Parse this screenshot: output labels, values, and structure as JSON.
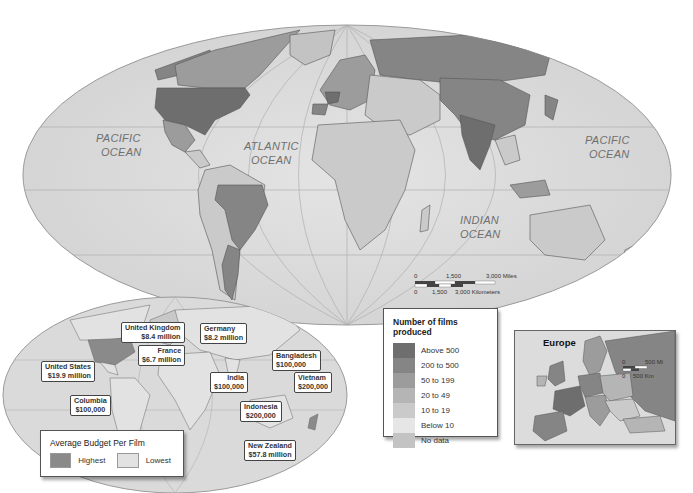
{
  "main_map": {
    "oceans": [
      {
        "name": "pacific-west",
        "line1": "PACIFIC",
        "line2": "OCEAN"
      },
      {
        "name": "atlantic",
        "line1": "ATLANTIC",
        "line2": "OCEAN"
      },
      {
        "name": "indian",
        "line1": "INDIAN",
        "line2": "OCEAN"
      },
      {
        "name": "pacific-east",
        "line1": "PACIFIC",
        "line2": "OCEAN"
      }
    ],
    "scale_bar": {
      "miles": [
        "0",
        "1,500",
        "3,000 Miles"
      ],
      "kilometers": [
        "0",
        "1,500",
        "3,000 Kilometers"
      ]
    }
  },
  "films_legend": {
    "title": "Number of films produced",
    "items": [
      {
        "label": "Above 500",
        "color": "#6e6e6e"
      },
      {
        "label": "200 to 500",
        "color": "#858585"
      },
      {
        "label": "50 to 199",
        "color": "#9c9c9c"
      },
      {
        "label": "20 to 49",
        "color": "#b5b5b5"
      },
      {
        "label": "10 to 19",
        "color": "#cacaca"
      },
      {
        "label": "Below 10",
        "color": "#e6e6e6"
      },
      {
        "label": "No data",
        "color": "#c3c3c3"
      }
    ]
  },
  "budget_map": {
    "callouts": [
      {
        "country": "United Kingdom",
        "value": "$8.4 million"
      },
      {
        "country": "Germany",
        "value": "$8.2 million"
      },
      {
        "country": "France",
        "value": "$6.7 million"
      },
      {
        "country": "United States",
        "value": "$19.9 million"
      },
      {
        "country": "Bangladesh",
        "value": "$100,000"
      },
      {
        "country": "India",
        "value": "$100,000"
      },
      {
        "country": "Vietnam",
        "value": "$200,000"
      },
      {
        "country": "Columbia",
        "value": "$100,000"
      },
      {
        "country": "Indonesia",
        "value": "$200,000"
      },
      {
        "country": "New Zealand",
        "value": "$57.8 million"
      }
    ]
  },
  "budget_legend": {
    "title": "Average Budget Per Film",
    "items": [
      {
        "label": "Highest",
        "color": "#8a8a8a"
      },
      {
        "label": "Lowest",
        "color": "#e2e2e2"
      }
    ]
  },
  "europe_inset": {
    "title": "Europe",
    "scale_bar": {
      "miles": [
        "0",
        "500 Mi"
      ],
      "kilometers": [
        "0",
        "500 Km"
      ]
    }
  }
}
